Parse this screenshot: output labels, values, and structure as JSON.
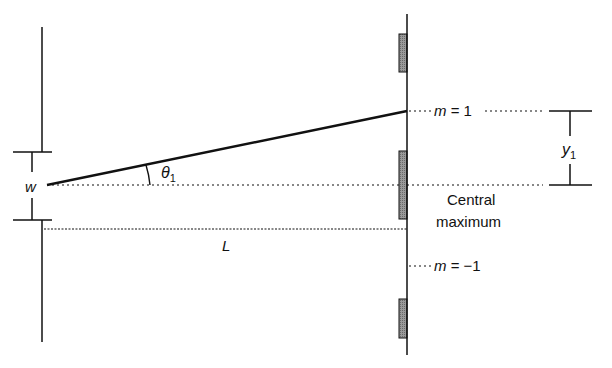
{
  "diagram": {
    "labels": {
      "slit_width": "w",
      "angle": "θ",
      "angle_sub": "1",
      "distance": "L",
      "order_plus": "m = 1",
      "order_minus": "m = −1",
      "central_line1": "Central",
      "central_line2": "maximum",
      "y_symbol": "y",
      "y_sub": "1"
    },
    "elements": {
      "slit_barrier": "vertical barrier with slit of width w",
      "screen": "vertical screen with shaded dark fringes",
      "ray": "ray from slit to first-order maximum at angle θ1",
      "central_axis": "dotted line from slit to central maximum",
      "distance_line": "dotted line indicating distance L"
    },
    "colors": {
      "line": "#111111",
      "fringe_fill": "#8a8a8a",
      "background": "#ffffff"
    }
  }
}
